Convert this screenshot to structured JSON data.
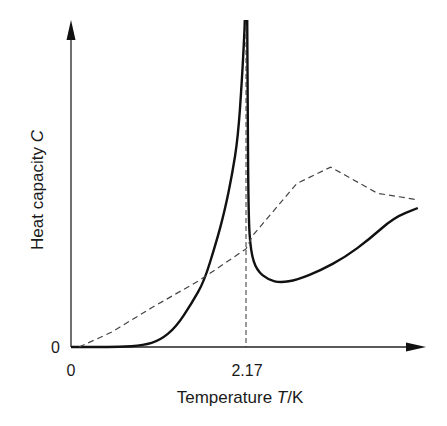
{
  "chart_data": {
    "type": "line",
    "title": "",
    "xlabel": "Temperature T/K",
    "ylabel": "Heat capacity C",
    "x_ticks": [
      {
        "value": 0,
        "label": "0"
      },
      {
        "value": 2.17,
        "label": "2.17"
      }
    ],
    "y_ticks": [
      {
        "value": 0,
        "label": "0"
      }
    ],
    "xlim": [
      0,
      4.3
    ],
    "ylim": [
      0,
      10
    ],
    "grid": false,
    "legend": "none",
    "annotations": [
      "vertical dashed line at T = 2.17 K (lambda point)"
    ],
    "series": [
      {
        "name": "Heat capacity of liquid helium (lambda transition)",
        "style": "solid",
        "points": [
          [
            0.0,
            0.0
          ],
          [
            0.3,
            0.0
          ],
          [
            0.6,
            0.0
          ],
          [
            0.9,
            0.05
          ],
          [
            1.1,
            0.2
          ],
          [
            1.3,
            0.6
          ],
          [
            1.5,
            1.35
          ],
          [
            1.65,
            2.0
          ],
          [
            1.8,
            3.2
          ],
          [
            1.9,
            4.1
          ],
          [
            2.0,
            5.3
          ],
          [
            2.07,
            6.4
          ],
          [
            2.12,
            8.2
          ],
          [
            2.15,
            9.6
          ],
          [
            2.155,
            10.0
          ],
          [
            2.185,
            10.0
          ],
          [
            2.19,
            8.0
          ],
          [
            2.2,
            4.0
          ],
          [
            2.23,
            2.9
          ],
          [
            2.3,
            2.35
          ],
          [
            2.45,
            2.05
          ],
          [
            2.6,
            1.97
          ],
          [
            2.8,
            2.05
          ],
          [
            3.1,
            2.35
          ],
          [
            3.4,
            2.75
          ],
          [
            3.7,
            3.3
          ],
          [
            4.0,
            3.95
          ],
          [
            4.3,
            4.25
          ]
        ]
      },
      {
        "name": "Comparison (dashed)",
        "style": "dashed",
        "points": [
          [
            0.1,
            0.0
          ],
          [
            0.5,
            0.45
          ],
          [
            1.0,
            1.2
          ],
          [
            1.6,
            2.05
          ],
          [
            2.17,
            3.0
          ],
          [
            2.25,
            3.4
          ],
          [
            2.8,
            5.0
          ],
          [
            3.22,
            5.5
          ],
          [
            3.8,
            4.7
          ],
          [
            4.3,
            4.5
          ]
        ]
      }
    ]
  },
  "labels": {
    "x_tick_0": "0",
    "x_tick_lambda": "2.17",
    "y_tick_0": "0",
    "x_axis_title_pre": "Temperature ",
    "x_axis_title_var": "T",
    "x_axis_title_post": "/K",
    "y_axis_title_pre": "Heat capacity ",
    "y_axis_title_var": "C"
  }
}
